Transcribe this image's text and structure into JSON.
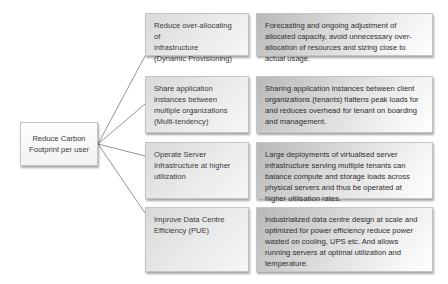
{
  "diagram": {
    "type": "tree",
    "root": {
      "label": "Reduce Carbon Footprint per user"
    },
    "branches": [
      {
        "strategy": "Reduce over-allocating of infrastructure (Dynamic Provisioning)",
        "strategy_lines": [
          "Reduce over-allocating of",
          "infrastructure",
          "(Dynamic Provisioning)"
        ],
        "description": "Forecasting and ongoing adjustment of allocated capacity, avoid unnecessary over-allocation of resources and sizing close to actual usage."
      },
      {
        "strategy": "Share application instances between multiple organizations (Multi-tendency)",
        "strategy_lines": [
          "Share application",
          "instances between",
          "multiple organizations",
          "(Multi-tendency)"
        ],
        "description": "Sharing application instances between client organizations (tenants) flattens peak loads for and reduces overhead for tenant on boarding and management."
      },
      {
        "strategy": "Operate Server Infrastructure at higher utilization",
        "strategy_lines": [
          "Operate Server",
          "Infrastructure at higher",
          "utilization"
        ],
        "description": "Large deployments of virtualised server infrastructure serving multiple tenants can balance compute and storage loads across physical servers and thus be operated at higher utilisation rates."
      },
      {
        "strategy": "Improve Data Centre Efficiency (PUE)",
        "strategy_lines": [
          "Improve Data Centre",
          "Efficiency (PUE)"
        ],
        "description": "Industrialized data centre design at scale and optimized for power efficiency reduce power wasted on cooling, UPS etc. And allows running servers at optimal utilization and temperature."
      }
    ],
    "colors": {
      "box_border": "#c4c4c4",
      "connector": "#7a7a7a",
      "text": "#3a3a3a"
    }
  }
}
